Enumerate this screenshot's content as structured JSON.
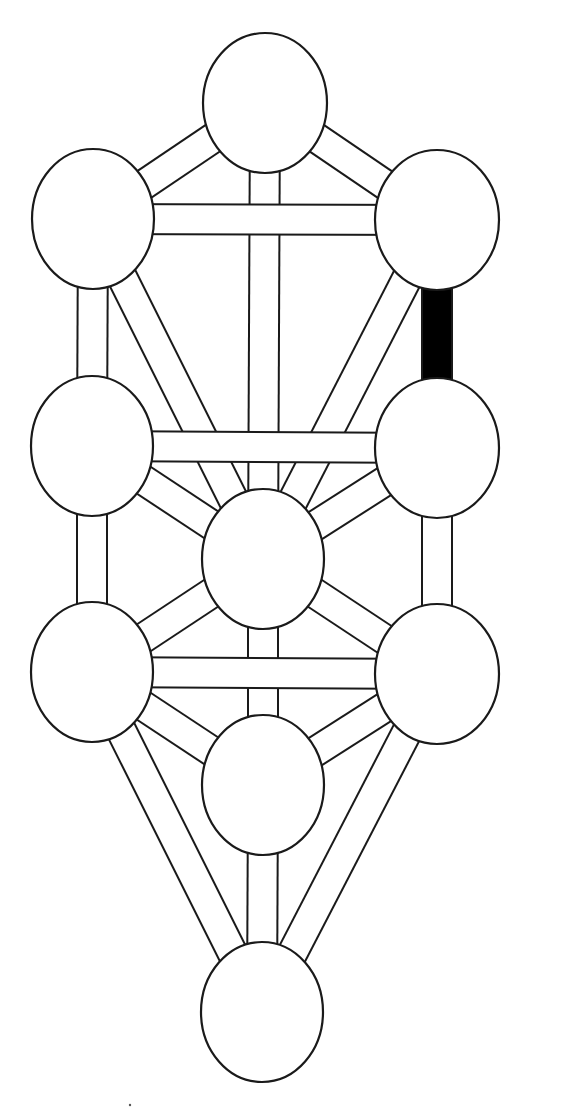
{
  "diagram": {
    "title": "",
    "type": "tree-of-life",
    "background": "#ffffff",
    "stroke_color": "#1a1a1a",
    "highlight_color": "#000000",
    "path_half_width": 15,
    "nodes": [
      {
        "id": "n1",
        "label": "",
        "cx": 265,
        "cy": 103,
        "rx": 62,
        "ry": 70
      },
      {
        "id": "n2",
        "label": "",
        "cx": 437,
        "cy": 220,
        "rx": 62,
        "ry": 70
      },
      {
        "id": "n3",
        "label": "",
        "cx": 93,
        "cy": 219,
        "rx": 61,
        "ry": 70
      },
      {
        "id": "n4",
        "label": "",
        "cx": 437,
        "cy": 448,
        "rx": 62,
        "ry": 70
      },
      {
        "id": "n5",
        "label": "",
        "cx": 92,
        "cy": 446,
        "rx": 61,
        "ry": 70
      },
      {
        "id": "n6",
        "label": "",
        "cx": 263,
        "cy": 559,
        "rx": 61,
        "ry": 70
      },
      {
        "id": "n7",
        "label": "",
        "cx": 437,
        "cy": 674,
        "rx": 62,
        "ry": 70
      },
      {
        "id": "n8",
        "label": "",
        "cx": 92,
        "cy": 672,
        "rx": 61,
        "ry": 70
      },
      {
        "id": "n9",
        "label": "",
        "cx": 263,
        "cy": 785,
        "rx": 61,
        "ry": 70
      },
      {
        "id": "n10",
        "label": "",
        "cx": 262,
        "cy": 1012,
        "rx": 61,
        "ry": 70
      }
    ],
    "paths": [
      {
        "from": "n1",
        "to": "n2",
        "highlighted": false
      },
      {
        "from": "n1",
        "to": "n3",
        "highlighted": false
      },
      {
        "from": "n1",
        "to": "n6",
        "highlighted": false
      },
      {
        "from": "n2",
        "to": "n3",
        "highlighted": false
      },
      {
        "from": "n2",
        "to": "n4",
        "highlighted": true
      },
      {
        "from": "n2",
        "to": "n6",
        "highlighted": false
      },
      {
        "from": "n3",
        "to": "n5",
        "highlighted": false
      },
      {
        "from": "n3",
        "to": "n6",
        "highlighted": false
      },
      {
        "from": "n4",
        "to": "n5",
        "highlighted": false
      },
      {
        "from": "n4",
        "to": "n6",
        "highlighted": false
      },
      {
        "from": "n4",
        "to": "n7",
        "highlighted": false
      },
      {
        "from": "n5",
        "to": "n6",
        "highlighted": false
      },
      {
        "from": "n5",
        "to": "n8",
        "highlighted": false
      },
      {
        "from": "n6",
        "to": "n7",
        "highlighted": false
      },
      {
        "from": "n6",
        "to": "n8",
        "highlighted": false
      },
      {
        "from": "n6",
        "to": "n9",
        "highlighted": false
      },
      {
        "from": "n7",
        "to": "n8",
        "highlighted": false
      },
      {
        "from": "n7",
        "to": "n9",
        "highlighted": false
      },
      {
        "from": "n7",
        "to": "n10",
        "highlighted": false
      },
      {
        "from": "n8",
        "to": "n9",
        "highlighted": false
      },
      {
        "from": "n8",
        "to": "n10",
        "highlighted": false
      },
      {
        "from": "n9",
        "to": "n10",
        "highlighted": false
      }
    ],
    "stray_marks": [
      {
        "x": 130,
        "y": 1105,
        "r": 1.2
      }
    ]
  }
}
